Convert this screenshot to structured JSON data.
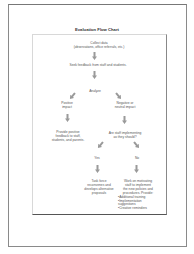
{
  "chart": {
    "title": "Evaluation Flow Chart",
    "nodes": {
      "collect": {
        "line1": "Collect data",
        "line2": "(observations, office referrals, etc.)"
      },
      "feedback": {
        "text": "Seek feedback from staff and students."
      },
      "analyze": {
        "text": "Analyze"
      },
      "positive": {
        "line1": "Positive",
        "line2": "impact"
      },
      "negative": {
        "line1": "Negative or",
        "line2": "neutral impact"
      },
      "provide": {
        "line1": "Provide positive",
        "line2": "feedback to staff,",
        "line3": "students, and parents."
      },
      "question": {
        "line1": "Are staff implementing",
        "line2": "as they should?"
      },
      "yes": {
        "text": "Yes"
      },
      "no": {
        "text": "No"
      },
      "taskforce": {
        "line1": "Task force",
        "line2": "reconvenes and",
        "line3": "develops alternative",
        "line4": "proposals"
      },
      "work": {
        "line1": "Work on motivating",
        "line2": "staff to implement",
        "line3": "the new policies and",
        "line4": "procedures. Provide:",
        "bullets": [
          "Additional training",
          "Implementation suggestions",
          "Creative reminders"
        ]
      }
    }
  },
  "colors": {
    "arrow": "#9a9a9a",
    "text": "#555555",
    "frame": "#8a8a8a"
  }
}
